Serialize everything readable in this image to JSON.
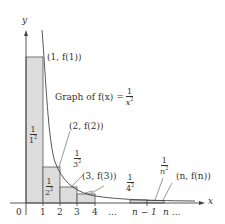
{
  "axes": {
    "x_label": "x",
    "y_label": "y",
    "origin": "0"
  },
  "ticks": [
    "1",
    "2",
    "3",
    "4",
    "…",
    "n − 1",
    "n …"
  ],
  "points": {
    "p1": "(1, f(1))",
    "p2": "(2, f(2))",
    "p3": "(3, f(3))",
    "pn": "(n, f(n))"
  },
  "graph_label": {
    "prefix": "Graph of f(x) =",
    "num": "1",
    "den": "x",
    "exp": "2"
  },
  "rect_labels": [
    {
      "num": "1",
      "den": "1",
      "exp": "2"
    },
    {
      "num": "1",
      "den": "2",
      "exp": "2"
    },
    {
      "num": "1",
      "den": "3",
      "exp": "2"
    },
    {
      "num": "1",
      "den": "4",
      "exp": "2"
    },
    {
      "num": "1",
      "den": "n",
      "exp": "2"
    }
  ],
  "colors": {
    "rect_fill": "#dcdcdc",
    "line": "#444444",
    "text": "#333333"
  }
}
